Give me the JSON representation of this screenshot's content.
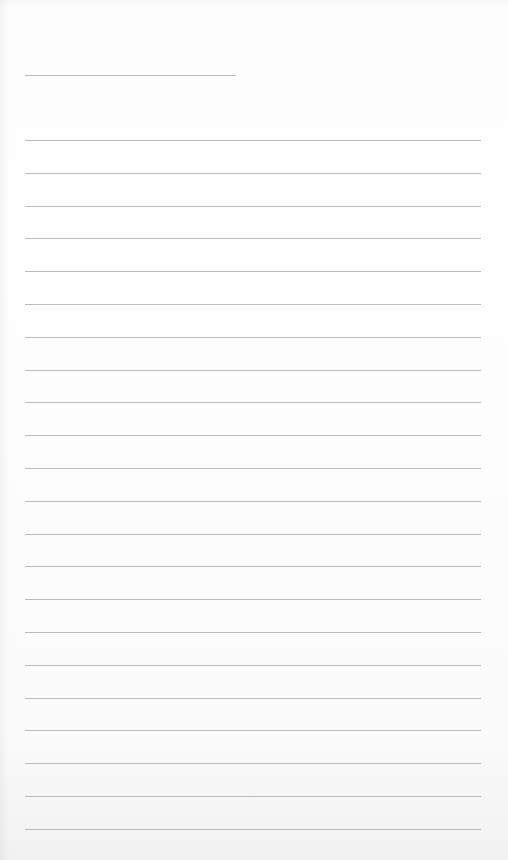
{
  "page": {
    "type": "lined-paper",
    "background_color": "#fdfdfd",
    "line_color": "#b4b4b4"
  },
  "header_line": {
    "x_start": 25,
    "x_end": 236,
    "y": 75
  },
  "ruled_lines": {
    "count": 22,
    "x_start": 25,
    "x_end": 481,
    "first_y": 140,
    "spacing": 32.8
  }
}
